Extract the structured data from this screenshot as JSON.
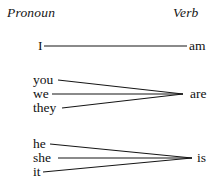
{
  "diagram": {
    "title_visible": false,
    "background_color": "#ffffff",
    "ink_color": "#161616",
    "columns": {
      "left_header": "Pronoun",
      "right_header": "Verb"
    },
    "groups": [
      {
        "id": "group-am",
        "verb": "am",
        "pronouns": [
          "I"
        ]
      },
      {
        "id": "group-are",
        "verb": "are",
        "pronouns": [
          "you",
          "we",
          "they"
        ]
      },
      {
        "id": "group-is",
        "verb": "is",
        "pronouns": [
          "he",
          "she",
          "it"
        ]
      }
    ],
    "labels": {
      "pronoun_i": "I",
      "pronoun_you": "you",
      "pronoun_we": "we",
      "pronoun_they": "they",
      "pronoun_he": "he",
      "pronoun_she": "she",
      "pronoun_it": "it",
      "verb_am": "am",
      "verb_are": "are",
      "verb_is": "is"
    },
    "connectors": [
      {
        "from": "I",
        "to": "am",
        "x1": 44,
        "y1": 46,
        "x2": 187,
        "y2": 46
      },
      {
        "from": "you",
        "to": "are",
        "x1": 58,
        "y1": 80,
        "x2": 183,
        "y2": 94
      },
      {
        "from": "we",
        "to": "are",
        "x1": 52,
        "y1": 94,
        "x2": 183,
        "y2": 94
      },
      {
        "from": "they",
        "to": "are",
        "x1": 62,
        "y1": 108,
        "x2": 183,
        "y2": 94
      },
      {
        "from": "he",
        "to": "is",
        "x1": 50,
        "y1": 144,
        "x2": 192,
        "y2": 158
      },
      {
        "from": "she",
        "to": "is",
        "x1": 58,
        "y1": 158,
        "x2": 192,
        "y2": 158
      },
      {
        "from": "it",
        "to": "is",
        "x1": 43,
        "y1": 172,
        "x2": 192,
        "y2": 158
      }
    ]
  }
}
